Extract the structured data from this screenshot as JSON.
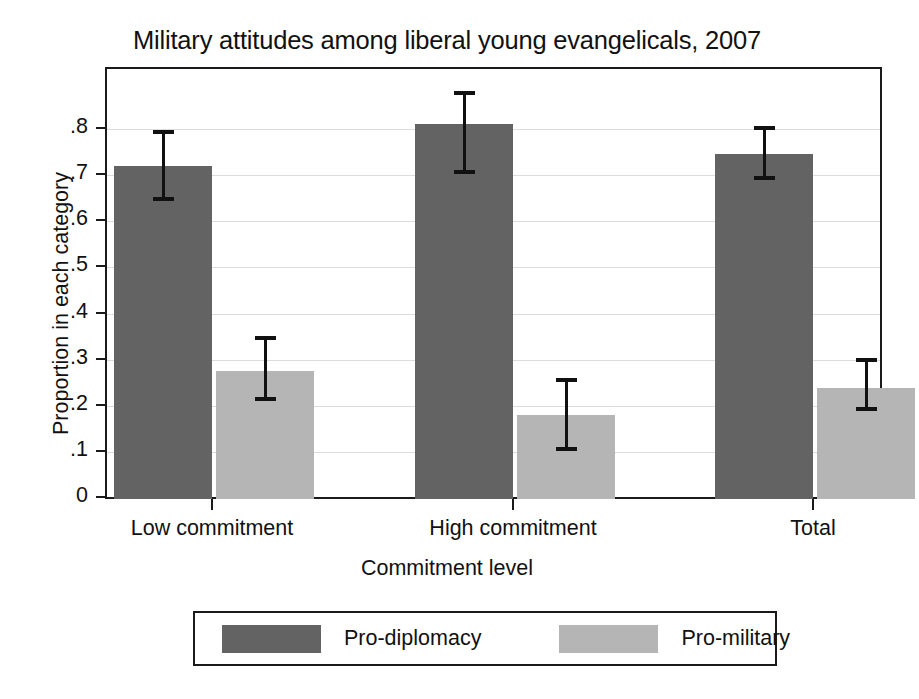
{
  "chart_data": {
    "type": "bar",
    "title": "Military attitudes among liberal young evangelicals, 2007",
    "subtitle": "",
    "xlabel": "Commitment level",
    "ylabel": "Proportion in each category",
    "categories": [
      "Low commitment",
      "High commitment",
      "Total"
    ],
    "ylim": [
      0,
      0.8
    ],
    "yticks": [
      0,
      0.1,
      0.2,
      0.3,
      0.4,
      0.5,
      0.6,
      0.7,
      0.8
    ],
    "ytick_labels": [
      "0",
      ".1",
      ".2",
      ".3",
      ".4",
      ".5",
      ".6",
      ".7",
      ".8"
    ],
    "grid": true,
    "grid_axis": "y",
    "legend_position": "bottom",
    "error_bars": "95% confidence interval",
    "series": [
      {
        "name": "Pro-diplomacy",
        "color": "#636363",
        "values": [
          0.722,
          0.812,
          0.748
        ],
        "err_low": [
          0.645,
          0.705,
          0.692
        ],
        "err_high": [
          0.8,
          0.885,
          0.808
        ]
      },
      {
        "name": "Pro-military",
        "color": "#b5b5b5",
        "values": [
          0.277,
          0.182,
          0.24
        ],
        "err_low": [
          0.212,
          0.103,
          0.19
        ],
        "err_high": [
          0.353,
          0.262,
          0.305
        ]
      }
    ]
  },
  "legend": {
    "items": [
      {
        "label": "Pro-diplomacy",
        "color": "#636363"
      },
      {
        "label": "Pro-military",
        "color": "#b5b5b5"
      }
    ]
  }
}
